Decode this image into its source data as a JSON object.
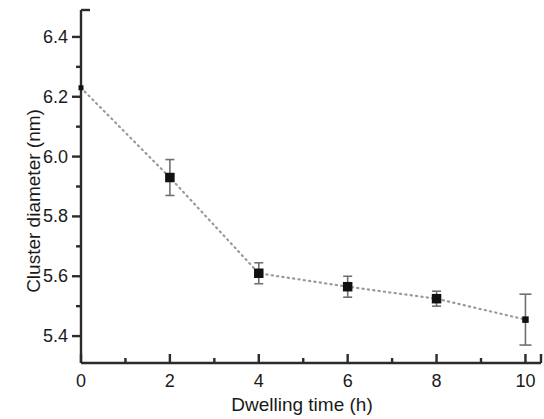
{
  "chart_data": {
    "type": "scatter",
    "title": "",
    "xlabel": "Dwelling time (h)",
    "ylabel": "Cluster diameter (nm)",
    "xlim": [
      0,
      10.35
    ],
    "ylim": [
      5.31,
      6.49
    ],
    "grid": false,
    "legend": false,
    "xticks": [
      0,
      2,
      4,
      6,
      8,
      10
    ],
    "xtick_labels": [
      "0",
      "2",
      "4",
      "6",
      "8",
      "10"
    ],
    "xminor_ticks": [
      1,
      3,
      5,
      7,
      9
    ],
    "yticks": [
      5.4,
      5.6,
      5.8,
      6.0,
      6.2,
      6.4
    ],
    "ytick_labels": [
      "5.4",
      "5.6",
      "5.8",
      "6.0",
      "6.2",
      "6.4"
    ],
    "yminor_ticks": [
      5.5,
      5.7,
      5.9,
      6.1,
      6.3
    ],
    "marker": "filled-square",
    "marker_color": "#111111",
    "line_style": "dotted",
    "line_color": "#9a9a9a",
    "x": [
      2,
      4,
      6,
      8,
      10
    ],
    "values": [
      5.93,
      5.61,
      5.565,
      5.525,
      5.455
    ],
    "yerr": [
      0.06,
      0.035,
      0.035,
      0.025,
      0.085
    ],
    "line_anchor": {
      "x": 0,
      "y": 6.23
    },
    "series": [
      {
        "name": "Cluster diameter",
        "points": [
          {
            "x": 0,
            "y": 6.23,
            "yerr": 0,
            "anchor_only": true
          },
          {
            "x": 2,
            "y": 5.93,
            "yerr": 0.06
          },
          {
            "x": 4,
            "y": 5.61,
            "yerr": 0.035
          },
          {
            "x": 6,
            "y": 5.565,
            "yerr": 0.035
          },
          {
            "x": 8,
            "y": 5.525,
            "yerr": 0.025
          },
          {
            "x": 10,
            "y": 5.455,
            "yerr": 0.085
          }
        ]
      }
    ]
  }
}
